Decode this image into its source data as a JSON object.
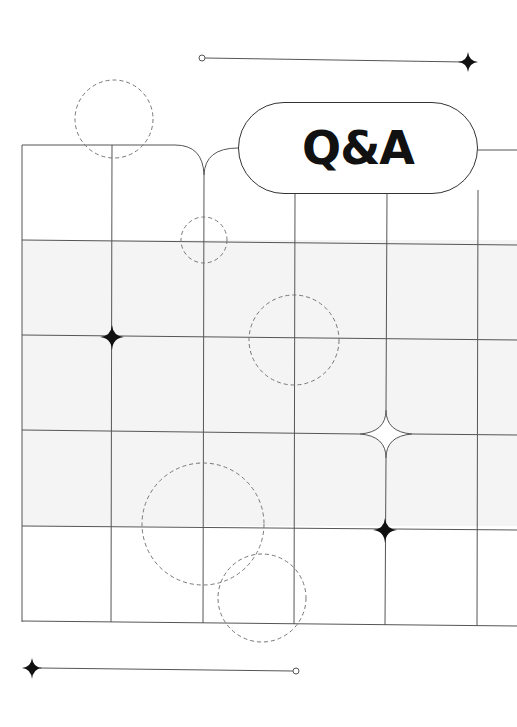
{
  "title": "Q&A",
  "colors": {
    "line": "#555555",
    "band": "#f4f4f4",
    "ink": "#111111",
    "dashed": "#777777"
  },
  "decorations": {
    "top_connector": {
      "start_marker": "open-circle",
      "end_marker": "four-point-star"
    },
    "bottom_connector": {
      "start_marker": "four-point-star",
      "end_marker": "open-circle"
    },
    "grid": {
      "columns": 5,
      "rows": 5,
      "shaded_rows": [
        1,
        2,
        3
      ]
    },
    "stars": [
      "four-point-star",
      "four-point-star",
      "outline-star"
    ],
    "dashed_circles": 6
  }
}
